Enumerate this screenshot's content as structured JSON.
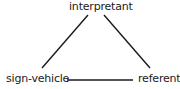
{
  "diagram": {
    "type": "semiotic-triangle",
    "nodes": {
      "top": "interpretant",
      "left": "sign-vehicle",
      "right": "referent"
    },
    "edges": [
      {
        "from": "interpretant",
        "to": "sign-vehicle",
        "style": "solid"
      },
      {
        "from": "interpretant",
        "to": "referent",
        "style": "solid"
      },
      {
        "from": "sign-vehicle",
        "to": "referent",
        "style": "solid"
      }
    ],
    "colors": {
      "line": "#1a1a1a",
      "text": "#1a1a1a",
      "background": "#ffffff"
    }
  }
}
